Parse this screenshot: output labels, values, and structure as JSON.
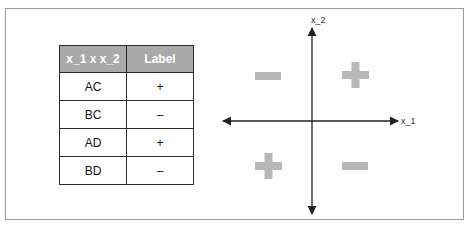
{
  "table": {
    "headers": [
      "x_1 x x_2",
      "Label"
    ],
    "rows": [
      {
        "input": "AC",
        "label": "+"
      },
      {
        "input": "BC",
        "label": "–"
      },
      {
        "input": "AD",
        "label": "+"
      },
      {
        "input": "BD",
        "label": "–"
      }
    ]
  },
  "plot": {
    "x_axis_label": "x_1",
    "y_axis_label": "x_2",
    "quadrants": {
      "top_left": "minus",
      "top_right": "plus",
      "bottom_left": "plus",
      "bottom_right": "minus"
    },
    "sign_color": "#b8b8b8",
    "axis_color": "#222222"
  },
  "colors": {
    "header_bg": "#a9a9a9",
    "header_text": "#ffffff",
    "border": "#2a2a2a"
  }
}
